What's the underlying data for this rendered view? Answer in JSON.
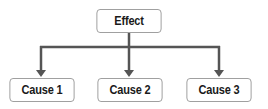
{
  "diagram": {
    "type": "cause-effect-tree",
    "root": {
      "label": "Effect"
    },
    "children": [
      {
        "label": "Cause 1"
      },
      {
        "label": "Cause 2"
      },
      {
        "label": "Cause 3"
      }
    ],
    "colors": {
      "connector": "#555555",
      "box_border": "#9a9a9a",
      "box_fill": "#ffffff",
      "text": "#1a1a1a"
    }
  }
}
